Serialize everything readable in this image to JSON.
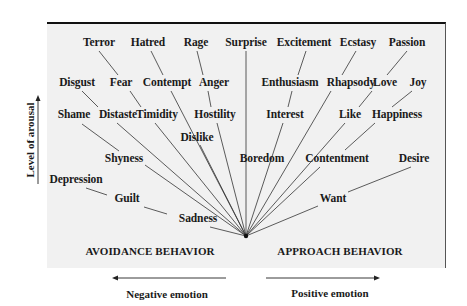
{
  "diagram": {
    "y_axis_label": "Level of arousal",
    "x_axis_negative_label": "Negative emotion",
    "x_axis_positive_label": "Positive emotion",
    "avoidance_label": "AVOIDANCE BEHAVIOR",
    "approach_label": "APPROACH BEHAVIOR",
    "vertex": [
      246,
      236
    ],
    "colors": {
      "box_background": "#f1f1f1",
      "line": "#333333",
      "text": "#1a1a1a"
    },
    "emotions": [
      {
        "id": "terror",
        "label": "Terror",
        "x": 99,
        "y": 43
      },
      {
        "id": "hatred",
        "label": "Hatred",
        "x": 148,
        "y": 43
      },
      {
        "id": "rage",
        "label": "Rage",
        "x": 196,
        "y": 43
      },
      {
        "id": "surprise",
        "label": "Surprise",
        "x": 246,
        "y": 43
      },
      {
        "id": "excitement",
        "label": "Excitement",
        "x": 304,
        "y": 43
      },
      {
        "id": "ecstasy",
        "label": "Ecstasy",
        "x": 358,
        "y": 43
      },
      {
        "id": "passion",
        "label": "Passion",
        "x": 407,
        "y": 43
      },
      {
        "id": "disgust",
        "label": "Disgust",
        "x": 77,
        "y": 83
      },
      {
        "id": "fear",
        "label": "Fear",
        "x": 121,
        "y": 83
      },
      {
        "id": "contempt",
        "label": "Contempt",
        "x": 167,
        "y": 83
      },
      {
        "id": "anger",
        "label": "Anger",
        "x": 214,
        "y": 83
      },
      {
        "id": "enthusiasm",
        "label": "Enthusiasm",
        "x": 290,
        "y": 83
      },
      {
        "id": "rhapsody",
        "label": "Rhapsody",
        "x": 351,
        "y": 83
      },
      {
        "id": "love",
        "label": "Love",
        "x": 385,
        "y": 83
      },
      {
        "id": "joy",
        "label": "Joy",
        "x": 418,
        "y": 83
      },
      {
        "id": "shame",
        "label": "Shame",
        "x": 74,
        "y": 115
      },
      {
        "id": "distaste",
        "label": "Distaste",
        "x": 118,
        "y": 115
      },
      {
        "id": "timidity",
        "label": "Timidity",
        "x": 157,
        "y": 115
      },
      {
        "id": "hostility",
        "label": "Hostility",
        "x": 215,
        "y": 115
      },
      {
        "id": "interest",
        "label": "Interest",
        "x": 285,
        "y": 115
      },
      {
        "id": "like",
        "label": "Like",
        "x": 350,
        "y": 115
      },
      {
        "id": "happiness",
        "label": "Happiness",
        "x": 397,
        "y": 115
      },
      {
        "id": "dislike",
        "label": "Dislike",
        "x": 197,
        "y": 138
      },
      {
        "id": "shyness",
        "label": "Shyness",
        "x": 124,
        "y": 159
      },
      {
        "id": "boredom",
        "label": "Boredom",
        "x": 262,
        "y": 159
      },
      {
        "id": "contentment",
        "label": "Contentment",
        "x": 337,
        "y": 159
      },
      {
        "id": "desire",
        "label": "Desire",
        "x": 414,
        "y": 159
      },
      {
        "id": "depression",
        "label": "Depression",
        "x": 76,
        "y": 180
      },
      {
        "id": "guilt",
        "label": "Guilt",
        "x": 127,
        "y": 199
      },
      {
        "id": "want",
        "label": "Want",
        "x": 333,
        "y": 199
      },
      {
        "id": "sadness",
        "label": "Sadness",
        "x": 198,
        "y": 219
      }
    ],
    "connectors": [
      {
        "from": "terror",
        "to": "fear",
        "points": [
          99,
          51,
          118,
          75
        ]
      },
      {
        "from": "hatred",
        "to": "contempt",
        "points": [
          151,
          51,
          163,
          75
        ]
      },
      {
        "from": "rage",
        "to": "anger",
        "points": [
          197,
          51,
          203,
          75
        ]
      },
      {
        "from": "excitement",
        "to": "enthusiasm",
        "points": [
          306,
          51,
          298,
          75
        ]
      },
      {
        "from": "ecstasy",
        "to": "rhapsody",
        "points": [
          356,
          51,
          342,
          75
        ]
      },
      {
        "from": "passion",
        "to": "love",
        "points": [
          407,
          51,
          387,
          75
        ]
      },
      {
        "from": "disgust",
        "to": "distaste",
        "points": [
          82,
          91,
          98,
          107
        ]
      },
      {
        "from": "fear",
        "to": "timidity",
        "points": [
          130,
          91,
          141,
          107
        ]
      },
      {
        "from": "love",
        "to": "like",
        "points": [
          372,
          91,
          359,
          107
        ]
      },
      {
        "from": "joy",
        "to": "happiness",
        "points": [
          412,
          91,
          392,
          107
        ]
      },
      {
        "from": "anger",
        "to": "hostility",
        "points": [
          208,
          91,
          211,
          107
        ]
      },
      {
        "from": "enthusiasm",
        "to": "interest",
        "points": [
          292,
          91,
          288,
          107
        ]
      },
      {
        "from": "shame",
        "to": "shyness",
        "points": [
          82,
          124,
          119,
          151
        ]
      },
      {
        "from": "happiness",
        "to": "contentment",
        "points": [
          375,
          123,
          345,
          150
        ]
      },
      {
        "from": "depression",
        "to": "guilt",
        "points": [
          86,
          188,
          107,
          195
        ]
      },
      {
        "from": "guilt",
        "to": "sadness",
        "points": [
          144,
          207,
          167,
          214
        ]
      },
      {
        "from": "desire",
        "to": "want",
        "points": [
          411,
          167,
          348,
          192
        ]
      }
    ],
    "rays": [
      {
        "from": "surprise",
        "start": [
          246,
          51
        ]
      },
      {
        "from": "contempt",
        "start": [
          171,
          91
        ]
      },
      {
        "from": "distaste",
        "start": [
          117,
          123
        ]
      },
      {
        "from": "timidity",
        "start": [
          155,
          123
        ]
      },
      {
        "from": "hostility",
        "start": [
          217,
          123
        ]
      },
      {
        "from": "dislike",
        "start": [
          200,
          145
        ]
      },
      {
        "from": "shyness",
        "start": [
          145,
          165
        ]
      },
      {
        "from": "sadness",
        "start": [
          210,
          227
        ]
      },
      {
        "from": "interest",
        "start": [
          283,
          123
        ]
      },
      {
        "from": "rhapsody",
        "start": [
          331,
          91
        ]
      },
      {
        "from": "like",
        "start": [
          345,
          123
        ]
      },
      {
        "from": "contentment",
        "start": [
          320,
          167
        ]
      },
      {
        "from": "want",
        "start": [
          318,
          206
        ]
      }
    ]
  }
}
